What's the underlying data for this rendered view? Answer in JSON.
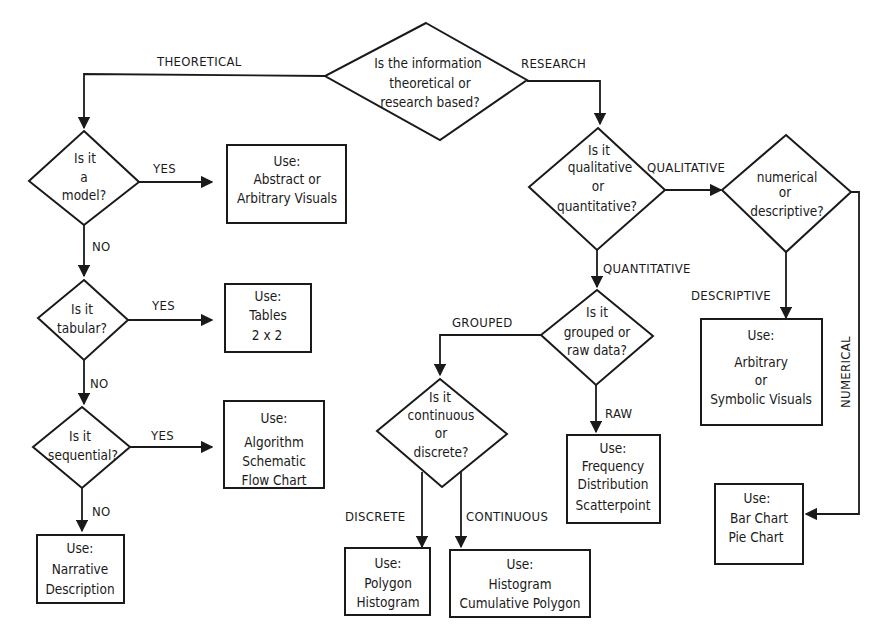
{
  "diagram": {
    "type": "flowchart",
    "nodes": {
      "root": {
        "kind": "decision",
        "lines": [
          "Is the information",
          "theoretical or",
          "research based?"
        ]
      },
      "model": {
        "kind": "decision",
        "lines": [
          "Is it",
          "a",
          "model?"
        ]
      },
      "tabular": {
        "kind": "decision",
        "lines": [
          "Is it",
          "tabular?"
        ]
      },
      "sequential": {
        "kind": "decision",
        "lines": [
          "Is it",
          "sequential?"
        ]
      },
      "qualquant": {
        "kind": "decision",
        "lines": [
          "Is it",
          "qualitative",
          "or",
          "quantitative?"
        ]
      },
      "numdesc": {
        "kind": "decision",
        "lines": [
          "numerical",
          "or",
          "descriptive?"
        ]
      },
      "grouped": {
        "kind": "decision",
        "lines": [
          "Is it",
          "grouped or",
          "raw data?"
        ]
      },
      "contdisc": {
        "kind": "decision",
        "lines": [
          "Is it",
          "continuous",
          "or",
          "discrete?"
        ]
      },
      "abstract": {
        "kind": "result",
        "lines": [
          "Use:",
          "Abstract or",
          "Arbitrary Visuals"
        ]
      },
      "tables": {
        "kind": "result",
        "lines": [
          "Use:",
          "Tables",
          "2 x 2"
        ]
      },
      "algorithm": {
        "kind": "result",
        "lines": [
          "Use:",
          "Algorithm",
          "Schematic",
          "Flow Chart"
        ]
      },
      "narrative": {
        "kind": "result",
        "lines": [
          "Use:",
          "Narrative",
          "Description"
        ]
      },
      "arbitrary": {
        "kind": "result",
        "lines": [
          "Use:",
          "Arbitrary",
          "or",
          "Symbolic Visuals"
        ]
      },
      "frequency": {
        "kind": "result",
        "lines": [
          "Use:",
          "Frequency",
          "Distribution",
          "Scatterpoint"
        ]
      },
      "barpie": {
        "kind": "result",
        "lines": [
          "Use:",
          "Bar Chart",
          "Pie Chart"
        ]
      },
      "polygon": {
        "kind": "result",
        "lines": [
          "Use:",
          "Polygon",
          "Histogram"
        ]
      },
      "histogram": {
        "kind": "result",
        "lines": [
          "Use:",
          "Histogram",
          "Cumulative Polygon"
        ]
      }
    },
    "edges": [
      {
        "from": "root",
        "to": "model",
        "label": "THEORETICAL"
      },
      {
        "from": "root",
        "to": "qualquant",
        "label": "RESEARCH"
      },
      {
        "from": "model",
        "to": "abstract",
        "label": "YES"
      },
      {
        "from": "model",
        "to": "tabular",
        "label": "NO"
      },
      {
        "from": "tabular",
        "to": "tables",
        "label": "YES"
      },
      {
        "from": "tabular",
        "to": "sequential",
        "label": "NO"
      },
      {
        "from": "sequential",
        "to": "algorithm",
        "label": "YES"
      },
      {
        "from": "sequential",
        "to": "narrative",
        "label": "NO"
      },
      {
        "from": "qualquant",
        "to": "numdesc",
        "label": "QUALITATIVE"
      },
      {
        "from": "qualquant",
        "to": "grouped",
        "label": "QUANTITATIVE"
      },
      {
        "from": "numdesc",
        "to": "arbitrary",
        "label": "DESCRIPTIVE"
      },
      {
        "from": "numdesc",
        "to": "barpie",
        "label": "NUMERICAL"
      },
      {
        "from": "grouped",
        "to": "contdisc",
        "label": "GROUPED"
      },
      {
        "from": "grouped",
        "to": "frequency",
        "label": "RAW"
      },
      {
        "from": "contdisc",
        "to": "polygon",
        "label": "DISCRETE"
      },
      {
        "from": "contdisc",
        "to": "histogram",
        "label": "CONTINUOUS"
      }
    ]
  },
  "labels": {
    "theoretical": "THEORETICAL",
    "research": "RESEARCH",
    "model_yes": "YES",
    "model_no": "NO",
    "tabular_yes": "YES",
    "tabular_no": "NO",
    "sequential_yes": "YES",
    "sequential_no": "NO",
    "qualitative": "QUALITATIVE",
    "quantitative": "QUANTITATIVE",
    "descriptive": "DESCRIPTIVE",
    "numerical": "NUMERICAL",
    "grouped": "GROUPED",
    "raw": "RAW",
    "discrete": "DISCRETE",
    "continuous": "CONTINUOUS"
  },
  "colors": {
    "ink": "#1a1a1a",
    "background": "#ffffff"
  }
}
